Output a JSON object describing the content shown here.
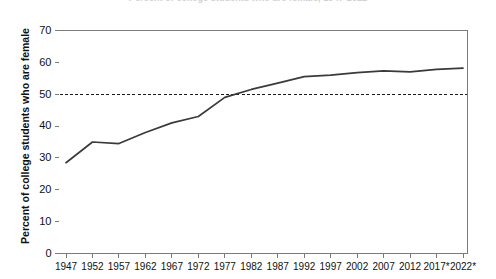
{
  "chart_data": {
    "type": "line",
    "title": "Percent of college students who are female, 1947-2022",
    "xlabel": "",
    "ylabel": "Percent of college students who are female",
    "categories": [
      "1947",
      "1952",
      "1957",
      "1962",
      "1967",
      "1972",
      "1977",
      "1982",
      "1987",
      "1992",
      "1997",
      "2002",
      "2007",
      "2012",
      "2017*",
      "2022*"
    ],
    "x": [
      1947,
      1952,
      1957,
      1962,
      1967,
      1972,
      1977,
      1982,
      1987,
      1992,
      1997,
      2002,
      2007,
      2012,
      2017,
      2022
    ],
    "values": [
      28.5,
      35.0,
      34.5,
      38.0,
      41.0,
      43.0,
      49.0,
      51.5,
      53.5,
      55.5,
      56.0,
      56.8,
      57.3,
      57.0,
      57.8,
      58.2
    ],
    "series": [
      {
        "name": "Percent of college students who are female",
        "values": [
          28.5,
          35.0,
          34.5,
          38.0,
          41.0,
          43.0,
          49.0,
          51.5,
          53.5,
          55.5,
          56.0,
          56.8,
          57.3,
          57.0,
          57.8,
          58.2
        ]
      }
    ],
    "ylim": [
      0,
      70
    ],
    "yticks": [
      0,
      10,
      20,
      30,
      40,
      50,
      60,
      70
    ],
    "ytick_labels": [
      "0",
      "10",
      "20",
      "30",
      "40",
      "50",
      "60",
      "70"
    ],
    "xtick_labels": [
      "1947",
      "1952",
      "1957",
      "1962",
      "1967",
      "1972",
      "1977",
      "1982",
      "1987",
      "1992",
      "1997",
      "2002",
      "2007",
      "2012",
      "2017*",
      "2022*"
    ],
    "grid": false,
    "legend": "none",
    "annotations": [
      {
        "name": "parity-reference-line",
        "type": "horizontal-dashed-line",
        "value": 50,
        "label": ""
      }
    ],
    "line_color": "#3a3a3a",
    "reference_line_color": "#1a1a1a",
    "axis_color": "#7a7a7a",
    "background_color": "#ffffff"
  }
}
